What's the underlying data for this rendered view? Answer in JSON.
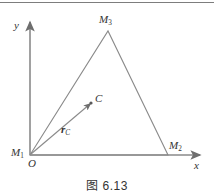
{
  "figure": {
    "caption": "图 6.13",
    "axes": {
      "x_label": "x",
      "y_label": "y",
      "origin_label": "O"
    },
    "points": [
      {
        "id": "M1",
        "base": "M",
        "subscript": "1",
        "label": "M",
        "x": 30,
        "y": 155
      },
      {
        "id": "M2",
        "base": "M",
        "subscript": "2",
        "label": "M",
        "x": 168,
        "y": 155
      },
      {
        "id": "M3",
        "base": "M",
        "subscript": "3",
        "label": "M",
        "x": 108,
        "y": 31
      },
      {
        "id": "C",
        "base": "C",
        "subscript": "",
        "label": "C",
        "x": 91,
        "y": 103
      }
    ],
    "vector": {
      "base": "r",
      "subscript": "C",
      "from": "M1",
      "to": "C"
    },
    "colors": {
      "line": "#8a8a8a",
      "text": "#333333",
      "rule": "#7d7d7d",
      "background": "#ffffff"
    }
  }
}
